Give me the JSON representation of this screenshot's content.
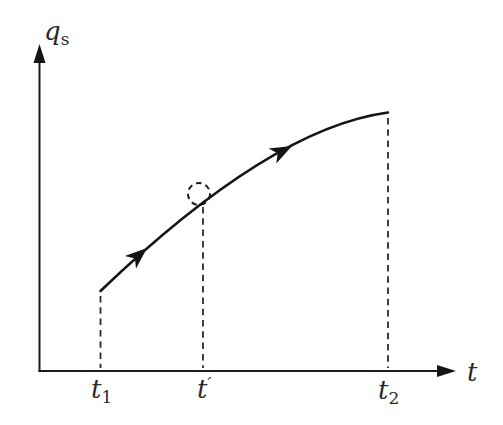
{
  "figure": {
    "background_color": "#ffffff",
    "ink_color": "#1b1b1b",
    "y_axis": {
      "label_base": "q",
      "label_subscript": "s"
    },
    "x_axis": {
      "label": "t"
    },
    "x_ticks": [
      {
        "base": "t",
        "subscript": "1"
      },
      {
        "base": "t",
        "prime": "′"
      },
      {
        "base": "t",
        "subscript": "2"
      }
    ],
    "curve": {
      "shape": "monotonically increasing, concave down",
      "from_tick": "t1",
      "to_tick": "t2",
      "direction_arrowheads": 2,
      "highlight": "small dashed circle around the curve point at t′"
    },
    "guides": [
      "dashed vertical from curve down to axis at t1",
      "dashed vertical from curve down to axis at t′",
      "dashed vertical from curve down to axis at t2"
    ]
  }
}
